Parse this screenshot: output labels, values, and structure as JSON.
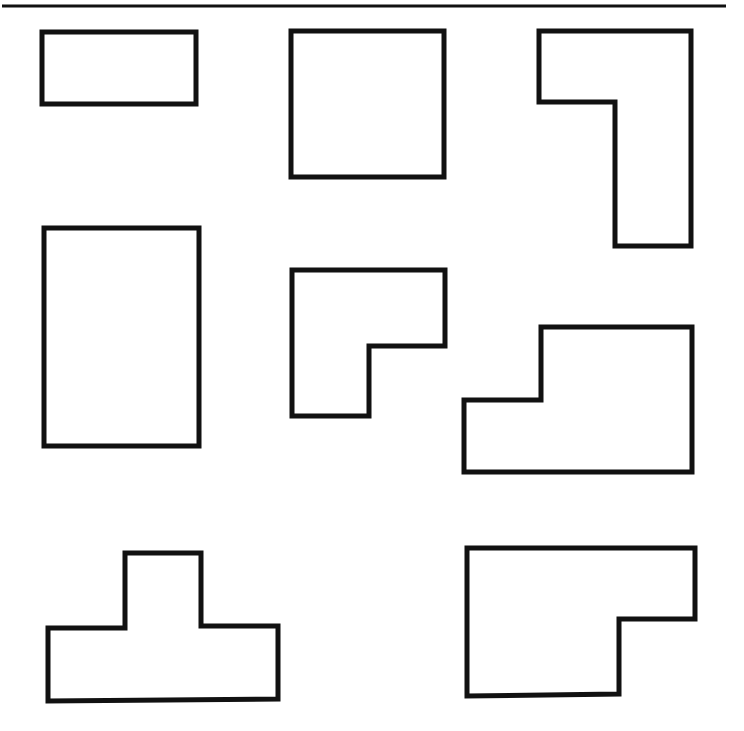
{
  "figure": {
    "stroke_color": "#111111",
    "background_color": "#ffffff",
    "top_rule": {
      "x1": 2,
      "y1": 6,
      "x2": 726,
      "y2": 6
    },
    "shapes": [
      {
        "name": "wide-rectangle",
        "kind": "rectangle",
        "points": "42,32 196,32 196,104 42,104"
      },
      {
        "name": "square",
        "kind": "square",
        "points": "291,31 444,31 444,177 291,177"
      },
      {
        "name": "l-shape-tall",
        "kind": "L-shape",
        "points": "539,31 691,31 691,246 615,246 615,102 539,102"
      },
      {
        "name": "tall-rectangle",
        "kind": "rectangle",
        "points": "44,228 199,228 199,446 44,446"
      },
      {
        "name": "l-shape-small",
        "kind": "L-shape",
        "points": "292,270 445,270 445,346 369,346 369,416 292,416"
      },
      {
        "name": "step-shape",
        "kind": "L-shape",
        "points": "541,327 692,327 692,472 464,472 464,400 541,400"
      },
      {
        "name": "t-shape",
        "kind": "T-shape",
        "points": "125,553 201,553 201,626 278,626 278,699 48,701 48,628 125,628"
      },
      {
        "name": "l-shape-wide",
        "kind": "L-shape",
        "points": "467,548 695,548 695,619 619,619 619,694 467,696"
      }
    ]
  }
}
